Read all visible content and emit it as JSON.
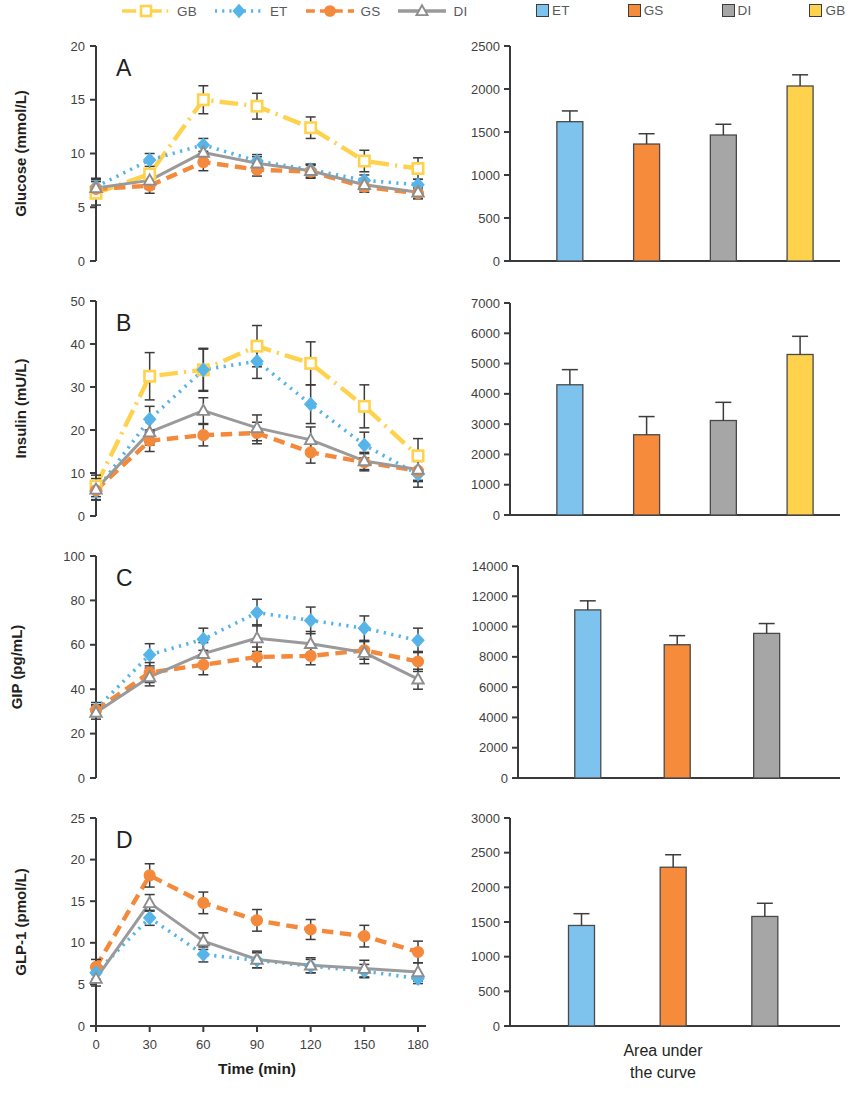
{
  "legends": {
    "line_legend": [
      {
        "key": "GB",
        "label": "GB",
        "color": "#FFD24D",
        "style": "long-dash-dot",
        "marker": "square-open"
      },
      {
        "key": "ET",
        "label": "ET",
        "color": "#56B4E8",
        "style": "dotted",
        "marker": "diamond"
      },
      {
        "key": "GS",
        "label": "GS",
        "color": "#F4893C",
        "style": "dashed",
        "marker": "circle"
      },
      {
        "key": "DI",
        "label": "DI",
        "color": "#9A9A9A",
        "style": "solid",
        "marker": "triangle-open"
      }
    ],
    "bar_legend": [
      {
        "key": "ET",
        "label": "ET",
        "color": "#7EC3EE"
      },
      {
        "key": "GS",
        "label": "GS",
        "color": "#F68B3C"
      },
      {
        "key": "DI",
        "label": "DI",
        "color": "#A6A6A6"
      },
      {
        "key": "GB",
        "label": "GB",
        "color": "#FFD24D"
      }
    ]
  },
  "axis_titles": {
    "x": "Time (min)",
    "auc": [
      "Area under",
      "the curve"
    ]
  },
  "chart_data": [
    {
      "id": "panel-a-lines",
      "panel_letter": "A",
      "type": "line",
      "title": "",
      "xlabel": "Time (min)",
      "ylabel": "Glucose (mmol/L)",
      "x": [
        0,
        30,
        60,
        90,
        120,
        150,
        180
      ],
      "xticks": [
        "0",
        "30",
        "60",
        "90",
        "120",
        "150",
        "180"
      ],
      "xlim": [
        0,
        180
      ],
      "ylim": [
        0,
        20
      ],
      "yticks": [
        0,
        5,
        10,
        15,
        20
      ],
      "grid": false,
      "legend_position": "top",
      "series": [
        {
          "name": "GB",
          "color": "#FFD24D",
          "style": "long-dash-dot",
          "marker": "square-open",
          "values": [
            6.3,
            8.1,
            15.0,
            14.4,
            12.4,
            9.3,
            8.6
          ],
          "errors": [
            1.1,
            1.3,
            1.3,
            1.2,
            1.0,
            1.0,
            1.0
          ]
        },
        {
          "name": "ET",
          "color": "#56B4E8",
          "style": "dotted",
          "marker": "diamond",
          "values": [
            6.9,
            9.4,
            10.8,
            9.3,
            8.5,
            7.5,
            7.1
          ],
          "errors": [
            0.8,
            0.6,
            0.6,
            0.6,
            0.5,
            0.5,
            0.5
          ]
        },
        {
          "name": "GS",
          "color": "#F4893C",
          "style": "dashed",
          "marker": "circle",
          "values": [
            6.7,
            7.0,
            9.2,
            8.5,
            8.3,
            6.9,
            6.3
          ],
          "errors": [
            0.7,
            0.7,
            0.8,
            0.6,
            0.6,
            0.5,
            0.5
          ]
        },
        {
          "name": "DI",
          "color": "#9A9A9A",
          "style": "solid",
          "marker": "triangle-open",
          "values": [
            6.8,
            7.5,
            10.1,
            9.1,
            8.4,
            7.1,
            6.4
          ],
          "errors": [
            0.8,
            0.8,
            0.7,
            0.6,
            0.6,
            0.5,
            0.6
          ]
        }
      ]
    },
    {
      "id": "panel-a-auc",
      "type": "bar",
      "title": "",
      "xlabel": "",
      "ylabel": "",
      "categories": [
        "ET",
        "GS",
        "DI",
        "GB"
      ],
      "values": [
        1620,
        1360,
        1465,
        2035
      ],
      "errors": [
        125,
        120,
        125,
        130
      ],
      "colors": [
        "#7EC3EE",
        "#F68B3C",
        "#A6A6A6",
        "#FFD24D"
      ],
      "ylim": [
        0,
        2500
      ],
      "yticks": [
        0,
        500,
        1000,
        1500,
        2000,
        2500
      ],
      "grid": false
    },
    {
      "id": "panel-b-lines",
      "panel_letter": "B",
      "type": "line",
      "xlabel": "Time (min)",
      "ylabel": "Insulin (mU/L)",
      "x": [
        0,
        30,
        60,
        90,
        120,
        150,
        180
      ],
      "xticks": [
        "0",
        "30",
        "60",
        "90",
        "120",
        "150",
        "180"
      ],
      "xlim": [
        0,
        180
      ],
      "ylim": [
        0,
        50
      ],
      "yticks": [
        0,
        10,
        20,
        30,
        40,
        50
      ],
      "grid": false,
      "series": [
        {
          "name": "GB",
          "color": "#FFD24D",
          "style": "long-dash-dot",
          "marker": "square-open",
          "values": [
            7.0,
            32.5,
            34.0,
            39.5,
            35.5,
            25.5,
            14.0
          ],
          "errors": [
            2.5,
            5.5,
            5.0,
            4.8,
            5.0,
            5.0,
            4.0
          ]
        },
        {
          "name": "ET",
          "color": "#56B4E8",
          "style": "dotted",
          "marker": "diamond",
          "values": [
            5.8,
            22.5,
            34.0,
            36.0,
            26.0,
            16.5,
            9.7
          ],
          "errors": [
            2.0,
            3.0,
            4.8,
            4.0,
            4.5,
            3.0,
            3.0
          ]
        },
        {
          "name": "GS",
          "color": "#F4893C",
          "style": "dashed",
          "marker": "circle",
          "values": [
            6.0,
            17.5,
            18.8,
            19.3,
            14.8,
            12.5,
            10.5
          ],
          "errors": [
            2.2,
            2.5,
            2.5,
            2.5,
            2.5,
            2.0,
            2.5
          ]
        },
        {
          "name": "DI",
          "color": "#9A9A9A",
          "style": "solid",
          "marker": "triangle-open",
          "values": [
            6.2,
            19.5,
            24.5,
            20.5,
            17.7,
            12.8,
            10.8
          ],
          "errors": [
            2.5,
            3.0,
            3.0,
            3.0,
            3.0,
            2.0,
            2.5
          ]
        }
      ]
    },
    {
      "id": "panel-b-auc",
      "type": "bar",
      "categories": [
        "ET",
        "GS",
        "DI",
        "GB"
      ],
      "values": [
        4300,
        2650,
        3120,
        5300
      ],
      "errors": [
        500,
        600,
        600,
        600
      ],
      "colors": [
        "#7EC3EE",
        "#F68B3C",
        "#A6A6A6",
        "#FFD24D"
      ],
      "ylim": [
        0,
        7000
      ],
      "yticks": [
        0,
        1000,
        2000,
        3000,
        4000,
        5000,
        6000,
        7000
      ],
      "grid": false
    },
    {
      "id": "panel-c-lines",
      "panel_letter": "C",
      "type": "line",
      "xlabel": "Time (min)",
      "ylabel": "GIP (pg/mL)",
      "x": [
        0,
        30,
        60,
        90,
        120,
        150,
        180
      ],
      "xticks": [
        "0",
        "30",
        "60",
        "90",
        "120",
        "150",
        "180"
      ],
      "xlim": [
        0,
        180
      ],
      "ylim": [
        0,
        100
      ],
      "yticks": [
        0,
        20,
        40,
        60,
        80,
        100
      ],
      "grid": false,
      "series": [
        {
          "name": "ET",
          "color": "#56B4E8",
          "style": "dotted",
          "marker": "diamond",
          "values": [
            31.0,
            55.5,
            62.5,
            74.5,
            71.0,
            67.5,
            62.0
          ],
          "errors": [
            3.0,
            5.0,
            5.0,
            6.0,
            6.0,
            5.5,
            5.5
          ]
        },
        {
          "name": "GS",
          "color": "#F4893C",
          "style": "dashed",
          "marker": "circle",
          "values": [
            30.5,
            47.5,
            51.0,
            54.5,
            55.0,
            57.5,
            52.5
          ],
          "errors": [
            2.5,
            4.5,
            4.5,
            4.5,
            4.0,
            4.0,
            4.5
          ]
        },
        {
          "name": "DI",
          "color": "#9A9A9A",
          "style": "solid",
          "marker": "triangle-open",
          "values": [
            29.5,
            45.5,
            56.0,
            63.0,
            60.5,
            56.5,
            44.5
          ],
          "errors": [
            3.0,
            4.0,
            5.0,
            6.0,
            5.5,
            5.0,
            4.5
          ]
        }
      ]
    },
    {
      "id": "panel-c-auc",
      "type": "bar",
      "categories": [
        "ET",
        "GS",
        "DI"
      ],
      "values": [
        11100,
        8800,
        9550
      ],
      "errors": [
        600,
        600,
        650
      ],
      "colors": [
        "#7EC3EE",
        "#F68B3C",
        "#A6A6A6"
      ],
      "ylim": [
        0,
        14000
      ],
      "yticks": [
        0,
        2000,
        4000,
        6000,
        8000,
        10000,
        12000,
        14000
      ],
      "grid": false
    },
    {
      "id": "panel-d-lines",
      "panel_letter": "D",
      "type": "line",
      "xlabel": "Time (min)",
      "ylabel": "GLP-1 (pmol/L)",
      "x": [
        0,
        30,
        60,
        90,
        120,
        150,
        180
      ],
      "xticks": [
        "0",
        "30",
        "60",
        "90",
        "120",
        "150",
        "180"
      ],
      "xlim": [
        0,
        180
      ],
      "ylim": [
        0,
        25
      ],
      "yticks": [
        0,
        5,
        10,
        15,
        20,
        25
      ],
      "grid": false,
      "series": [
        {
          "name": "GS",
          "color": "#F4893C",
          "style": "dashed",
          "marker": "circle",
          "values": [
            7.1,
            18.1,
            14.8,
            12.7,
            11.6,
            10.8,
            8.9
          ],
          "errors": [
            0.9,
            1.4,
            1.3,
            1.3,
            1.2,
            1.3,
            1.3
          ]
        },
        {
          "name": "ET",
          "color": "#56B4E8",
          "style": "dotted",
          "marker": "diamond",
          "values": [
            6.4,
            13.0,
            8.6,
            7.9,
            7.2,
            6.6,
            5.7
          ],
          "errors": [
            0.8,
            0.9,
            0.9,
            0.9,
            0.8,
            0.8,
            0.6
          ]
        },
        {
          "name": "DI",
          "color": "#9A9A9A",
          "style": "solid",
          "marker": "triangle-open",
          "values": [
            5.7,
            14.8,
            10.2,
            8.0,
            7.3,
            6.9,
            6.5
          ],
          "errors": [
            0.9,
            1.0,
            1.0,
            1.0,
            0.9,
            1.0,
            1.1
          ]
        }
      ]
    },
    {
      "id": "panel-d-auc",
      "type": "bar",
      "categories": [
        "ET",
        "GS",
        "DI"
      ],
      "values": [
        1450,
        2290,
        1580
      ],
      "errors": [
        170,
        180,
        190
      ],
      "colors": [
        "#7EC3EE",
        "#F68B3C",
        "#A6A6A6"
      ],
      "ylim": [
        0,
        3000
      ],
      "yticks": [
        0,
        500,
        1000,
        1500,
        2000,
        2500,
        3000
      ],
      "grid": false
    }
  ]
}
